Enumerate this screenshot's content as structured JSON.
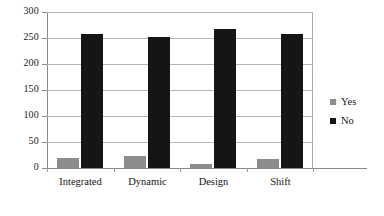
{
  "chart_data": {
    "type": "bar",
    "title": "",
    "xlabel": "",
    "ylabel": "",
    "categories": [
      "Integrated",
      "Dynamic",
      "Design",
      "Shift"
    ],
    "series": [
      {
        "name": "Yes",
        "color": "#8c8c8c",
        "values": [
          19,
          24,
          8,
          18
        ]
      },
      {
        "name": "No",
        "color": "#151515",
        "values": [
          257,
          251,
          268,
          257
        ]
      }
    ],
    "ylim": [
      0,
      300
    ],
    "ytick_values": [
      0,
      50,
      100,
      150,
      200,
      250,
      300
    ],
    "ytick_labels": [
      "0",
      "50",
      "100",
      "150",
      "200",
      "250",
      "300"
    ],
    "grid": true,
    "grid_axis": "y",
    "legend": {
      "position": "right",
      "entries": [
        "Yes",
        "No"
      ]
    },
    "annotations": []
  }
}
